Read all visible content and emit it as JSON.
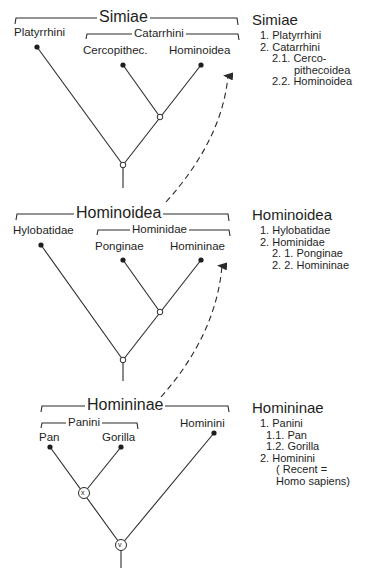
{
  "panels": [
    {
      "name": "Simiae",
      "bracket_label": "Simiae",
      "left_label": "Platyrrhini",
      "sub_bracket_label": "Catarrhini",
      "sub_left_label": "Cercopithec.",
      "sub_right_label": "Hominoidea",
      "legend": {
        "title": "Simiae",
        "items": [
          "1. Platyrrhini",
          "2. Catarrhini",
          "2.1. Cerco-",
          "pithecoidea",
          "2.2. Hominoidea"
        ]
      }
    },
    {
      "name": "Hominoidea",
      "bracket_label": "Hominoidea",
      "left_label": "Hylobatidae",
      "sub_bracket_label": "Hominidae",
      "sub_left_label": "Ponginae",
      "sub_right_label": "Homininae",
      "legend": {
        "title": "Hominoidea",
        "items": [
          "1. Hylobatidae",
          "2. Hominidae",
          "2. 1. Ponginae",
          "2. 2. Homininae"
        ]
      }
    },
    {
      "name": "Homininae",
      "bracket_label": "Homininae",
      "sub_bracket_label": "Panini",
      "sub_left_label": "Pan",
      "sub_right_label": "Gorilla",
      "right_label": "Hominini",
      "node_x_label": "x",
      "node_v_label": "v",
      "legend": {
        "title": "Homininae",
        "items": [
          "1. Panini",
          "1.1. Pan",
          "1.2. Gorilla",
          "2. Hominini",
          "( Recent =",
          "Homo sapiens)"
        ]
      }
    }
  ],
  "colors": {
    "line": "#2a2a2a",
    "text": "#1e1e1e",
    "background": "#ffffff"
  }
}
